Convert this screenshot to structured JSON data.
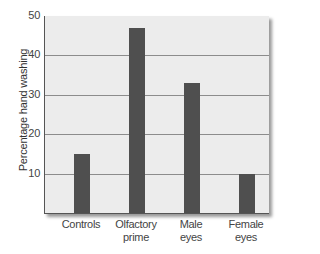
{
  "chart_data": {
    "type": "bar",
    "title": "",
    "xlabel": "",
    "ylabel": "Percentage hand washing",
    "ylim": [
      0,
      50
    ],
    "yticks": [
      10,
      20,
      30,
      40,
      50
    ],
    "grid": true,
    "categories": [
      "Controls",
      "Olfactory prime",
      "Male eyes",
      "Female eyes"
    ],
    "category_lines": [
      [
        "Controls"
      ],
      [
        "Olfactory",
        "prime"
      ],
      [
        "Male",
        "eyes"
      ],
      [
        "Female",
        "eyes"
      ]
    ],
    "values": [
      15,
      47,
      33,
      10
    ],
    "bar_color": "#4f4f4f",
    "background_color": "#ececec"
  }
}
